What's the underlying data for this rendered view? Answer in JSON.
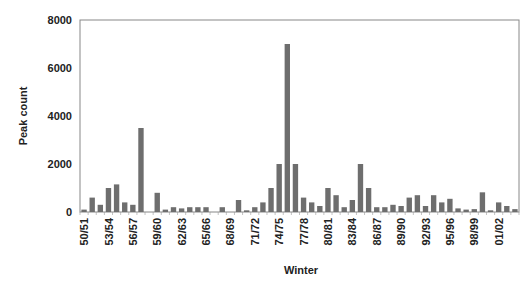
{
  "chart_data": {
    "type": "bar",
    "title": "",
    "xlabel": "Winter",
    "ylabel": "Peak count",
    "ylim": [
      0,
      8000
    ],
    "yticks": [
      0,
      2000,
      4000,
      6000,
      8000
    ],
    "grid": false,
    "legend": null,
    "bar_color": "#6e6e6e",
    "categories": [
      "50/51",
      "51/52",
      "52/53",
      "53/54",
      "54/55",
      "55/56",
      "56/57",
      "57/58",
      "58/59",
      "59/60",
      "60/61",
      "61/62",
      "62/63",
      "63/64",
      "64/65",
      "65/66",
      "66/67",
      "67/68",
      "68/69",
      "69/70",
      "70/71",
      "71/72",
      "72/73",
      "73/74",
      "74/75",
      "75/76",
      "76/77",
      "77/78",
      "78/79",
      "79/80",
      "80/81",
      "81/82",
      "82/83",
      "83/84",
      "84/85",
      "85/86",
      "86/87",
      "87/88",
      "88/89",
      "89/90",
      "90/91",
      "91/92",
      "92/93",
      "93/94",
      "94/95",
      "95/96",
      "96/97",
      "97/98",
      "98/99",
      "99/00",
      "00/01",
      "01/02",
      "02/03",
      "03/04"
    ],
    "values": [
      100,
      600,
      300,
      1000,
      1150,
      400,
      300,
      3500,
      0,
      800,
      100,
      200,
      150,
      200,
      200,
      200,
      0,
      200,
      0,
      500,
      70,
      200,
      400,
      1000,
      2000,
      7000,
      2000,
      600,
      400,
      250,
      1000,
      700,
      200,
      500,
      2000,
      1000,
      200,
      200,
      300,
      250,
      600,
      700,
      250,
      700,
      400,
      550,
      150,
      100,
      120,
      820,
      70,
      400,
      250,
      120
    ],
    "labeled_categories": [
      "50/51",
      "53/54",
      "56/57",
      "59/60",
      "62/63",
      "65/66",
      "68/69",
      "71/72",
      "74/75",
      "77/78",
      "80/81",
      "83/84",
      "86/87",
      "89/90",
      "92/93",
      "95/96",
      "98/99",
      "01/02"
    ]
  }
}
